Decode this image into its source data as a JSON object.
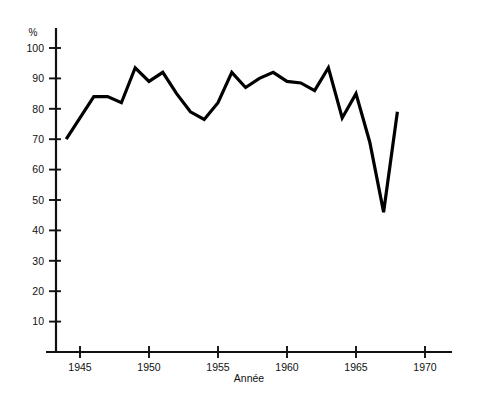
{
  "chart_data": {
    "type": "line",
    "title": "",
    "subtitle": "",
    "xlabel": "Année",
    "ylabel": "%",
    "ylabel_position": "top-left-of-axis",
    "xlim": [
      1944,
      1971
    ],
    "ylim": [
      0,
      105
    ],
    "grid": false,
    "legend": false,
    "legend_position": "none",
    "x_ticks": [
      1945,
      1950,
      1955,
      1960,
      1965,
      1970
    ],
    "x_tick_labels": [
      "1945",
      "1950",
      "1955",
      "1960",
      "1965",
      "1970"
    ],
    "y_ticks": [
      10,
      20,
      30,
      40,
      50,
      60,
      70,
      80,
      90,
      100
    ],
    "y_tick_labels": [
      "10",
      "20",
      "30",
      "40",
      "50",
      "60",
      "70",
      "80",
      "90",
      "100"
    ],
    "series": [
      {
        "name": "valeur",
        "color": "#000000",
        "x": [
          1944,
          1945,
          1946,
          1947,
          1948,
          1949,
          1950,
          1951,
          1952,
          1953,
          1954,
          1955,
          1956,
          1957,
          1958,
          1959,
          1960,
          1961,
          1962,
          1963,
          1964,
          1965,
          1966,
          1967,
          1968
        ],
        "values": [
          70,
          77,
          84,
          84,
          82,
          93.5,
          89,
          92,
          85,
          79,
          76.5,
          82,
          92,
          87,
          90,
          92,
          89,
          88.5,
          86,
          93.5,
          77,
          85,
          69,
          46,
          79
        ]
      }
    ]
  },
  "axes": {
    "y_unit": "%",
    "x_title": "Année"
  },
  "colors": {
    "line": "#000000",
    "axis": "#111111",
    "background": "#ffffff"
  }
}
